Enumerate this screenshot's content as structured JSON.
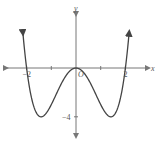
{
  "chart_data": {
    "type": "line",
    "title": "",
    "xlabel": "x",
    "ylabel": "y",
    "function": "x^4 - 4x^2",
    "xlim": [
      -3,
      3
    ],
    "ylim": [
      -6,
      2
    ],
    "x_ticks": [
      -2,
      -1,
      1,
      2
    ],
    "x_tick_labels": [
      {
        "value": -2,
        "label": "−2"
      },
      {
        "value": 2,
        "label": "2"
      }
    ],
    "y_ticks": [
      -4
    ],
    "y_tick_labels": [
      {
        "value": -4,
        "label": "−4"
      }
    ],
    "origin_label": "O",
    "series": [
      {
        "name": "f(x)",
        "x": [
          -2.15,
          -2,
          -1.8,
          -1.6,
          -1.414,
          -1.2,
          -1,
          -0.8,
          -0.5,
          -0.25,
          0,
          0.25,
          0.5,
          0.8,
          1,
          1.2,
          1.414,
          1.6,
          1.8,
          2,
          2.15
        ],
        "y": [
          1.38,
          0,
          -2.46,
          -3.69,
          -4,
          -3.69,
          -3,
          -2.15,
          -0.94,
          -0.25,
          0,
          -0.25,
          -0.94,
          -2.15,
          -3,
          -3.69,
          -4,
          -3.69,
          -2.46,
          0,
          1.38
        ]
      }
    ],
    "grid": false,
    "colors": {
      "axis": "#777777",
      "curve": "#444444",
      "text": "#555555"
    }
  }
}
